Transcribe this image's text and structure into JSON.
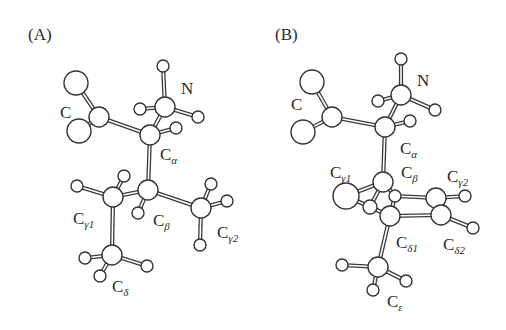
{
  "figure": {
    "type": "ball-and-stick molecular conformation diagram",
    "panels": [
      {
        "id": "A",
        "label": "(A)",
        "label_pos": [
          28,
          40
        ],
        "atoms": [
          {
            "id": "O1",
            "x": 76,
            "y": 83,
            "r": 12
          },
          {
            "id": "O2",
            "x": 79,
            "y": 131,
            "r": 12
          },
          {
            "id": "C",
            "x": 99,
            "y": 117,
            "r": 10
          },
          {
            "id": "Ca",
            "x": 150,
            "y": 135,
            "r": 10
          },
          {
            "id": "N",
            "x": 165,
            "y": 107,
            "r": 10
          },
          {
            "id": "HN1",
            "x": 163,
            "y": 66,
            "r": 6
          },
          {
            "id": "HN2",
            "x": 140,
            "y": 109,
            "r": 6
          },
          {
            "id": "HN3",
            "x": 198,
            "y": 117,
            "r": 6
          },
          {
            "id": "HCa",
            "x": 176,
            "y": 128,
            "r": 6
          },
          {
            "id": "Cb",
            "x": 148,
            "y": 190,
            "r": 10
          },
          {
            "id": "HCb",
            "x": 138,
            "y": 213,
            "r": 6
          },
          {
            "id": "Cg1",
            "x": 113,
            "y": 197,
            "r": 10
          },
          {
            "id": "HCg1a",
            "x": 124,
            "y": 176,
            "r": 6
          },
          {
            "id": "HCg1b",
            "x": 77,
            "y": 186,
            "r": 6
          },
          {
            "id": "Cg2",
            "x": 201,
            "y": 208,
            "r": 10
          },
          {
            "id": "HCg2a",
            "x": 211,
            "y": 184,
            "r": 6
          },
          {
            "id": "HCg2b",
            "x": 227,
            "y": 201,
            "r": 6
          },
          {
            "id": "HCg2c",
            "x": 200,
            "y": 245,
            "r": 6
          },
          {
            "id": "Cd",
            "x": 112,
            "y": 255,
            "r": 10
          },
          {
            "id": "HCda",
            "x": 85,
            "y": 258,
            "r": 6
          },
          {
            "id": "HCdb",
            "x": 100,
            "y": 276,
            "r": 6
          },
          {
            "id": "HCdc",
            "x": 147,
            "y": 266,
            "r": 6
          }
        ],
        "bonds": [
          [
            "O1",
            "C"
          ],
          [
            "O2",
            "C"
          ],
          [
            "C",
            "Ca"
          ],
          [
            "Ca",
            "N"
          ],
          [
            "N",
            "HN1"
          ],
          [
            "N",
            "HN2"
          ],
          [
            "N",
            "HN3"
          ],
          [
            "Ca",
            "HCa"
          ],
          [
            "Ca",
            "Cb"
          ],
          [
            "Cb",
            "HCb"
          ],
          [
            "Cb",
            "Cg1"
          ],
          [
            "Cb",
            "Cg2"
          ],
          [
            "Cg1",
            "HCg1a"
          ],
          [
            "Cg1",
            "HCg1b"
          ],
          [
            "Cg1",
            "Cd"
          ],
          [
            "Cg2",
            "HCg2a"
          ],
          [
            "Cg2",
            "HCg2b"
          ],
          [
            "Cg2",
            "HCg2c"
          ],
          [
            "Cd",
            "HCda"
          ],
          [
            "Cd",
            "HCdb"
          ],
          [
            "Cd",
            "HCdc"
          ]
        ],
        "labels": [
          {
            "name": "carboxyl-c",
            "base": "C",
            "sub": "",
            "x": 60,
            "y": 118
          },
          {
            "name": "n",
            "base": "N",
            "sub": "",
            "x": 181,
            "y": 94
          },
          {
            "name": "c-alpha",
            "base": "C",
            "sub": "α",
            "x": 160,
            "y": 160
          },
          {
            "name": "c-gamma1",
            "base": "C",
            "sub": "γ1",
            "x": 73,
            "y": 224
          },
          {
            "name": "c-beta",
            "base": "C",
            "sub": "β",
            "x": 153,
            "y": 226
          },
          {
            "name": "c-gamma2",
            "base": "C",
            "sub": "γ2",
            "x": 217,
            "y": 238
          },
          {
            "name": "c-delta",
            "base": "C",
            "sub": "δ",
            "x": 112,
            "y": 292
          }
        ]
      },
      {
        "id": "B",
        "label": "(B)",
        "label_pos": [
          275,
          40
        ],
        "atoms": [
          {
            "id": "O1",
            "x": 312,
            "y": 82,
            "r": 12
          },
          {
            "id": "O2",
            "x": 303,
            "y": 132,
            "r": 12
          },
          {
            "id": "C",
            "x": 332,
            "y": 117,
            "r": 10
          },
          {
            "id": "Ca",
            "x": 385,
            "y": 127,
            "r": 10
          },
          {
            "id": "N",
            "x": 401,
            "y": 95,
            "r": 10
          },
          {
            "id": "HN1",
            "x": 401,
            "y": 59,
            "r": 6
          },
          {
            "id": "HN2",
            "x": 378,
            "y": 101,
            "r": 6
          },
          {
            "id": "HN3",
            "x": 435,
            "y": 110,
            "r": 6
          },
          {
            "id": "HCa",
            "x": 410,
            "y": 121,
            "r": 6
          },
          {
            "id": "Cg1",
            "x": 346,
            "y": 196,
            "r": 13
          },
          {
            "id": "Hhid",
            "x": 370,
            "y": 207,
            "r": 7
          },
          {
            "id": "Cb",
            "x": 383,
            "y": 182,
            "r": 10
          },
          {
            "id": "HCb",
            "x": 395,
            "y": 196,
            "r": 6
          },
          {
            "id": "Cd1",
            "x": 390,
            "y": 216,
            "r": 10
          },
          {
            "id": "Cg2",
            "x": 436,
            "y": 198,
            "r": 10
          },
          {
            "id": "HCg2",
            "x": 465,
            "y": 196,
            "r": 6
          },
          {
            "id": "Cd2",
            "x": 441,
            "y": 215,
            "r": 10
          },
          {
            "id": "HCd2",
            "x": 473,
            "y": 228,
            "r": 6
          },
          {
            "id": "Ce",
            "x": 378,
            "y": 267,
            "r": 10
          },
          {
            "id": "HCea",
            "x": 342,
            "y": 265,
            "r": 6
          },
          {
            "id": "HCeb",
            "x": 406,
            "y": 281,
            "r": 6
          },
          {
            "id": "HCec",
            "x": 373,
            "y": 290,
            "r": 6
          }
        ],
        "bonds": [
          [
            "O1",
            "C"
          ],
          [
            "O2",
            "C"
          ],
          [
            "C",
            "Ca"
          ],
          [
            "Ca",
            "N"
          ],
          [
            "N",
            "HN1"
          ],
          [
            "N",
            "HN2"
          ],
          [
            "N",
            "HN3"
          ],
          [
            "Ca",
            "HCa"
          ],
          [
            "Ca",
            "Cb"
          ],
          [
            "Cb",
            "Cg1"
          ],
          [
            "Cg1",
            "Cd1"
          ],
          [
            "Cb",
            "Hhid"
          ],
          [
            "Cb",
            "HCb"
          ],
          [
            "HCb",
            "Cg2"
          ],
          [
            "HCb",
            "Cd1"
          ],
          [
            "Cg2",
            "HCg2"
          ],
          [
            "Cg2",
            "Cd2"
          ],
          [
            "Cd1",
            "Cd2"
          ],
          [
            "Cd2",
            "HCd2"
          ],
          [
            "Cd1",
            "Ce"
          ],
          [
            "Ce",
            "HCea"
          ],
          [
            "Ce",
            "HCeb"
          ],
          [
            "Ce",
            "HCec"
          ]
        ],
        "labels": [
          {
            "name": "carboxyl-c",
            "base": "C",
            "sub": "",
            "x": 291,
            "y": 110
          },
          {
            "name": "n",
            "base": "N",
            "sub": "",
            "x": 417,
            "y": 86
          },
          {
            "name": "c-alpha",
            "base": "C",
            "sub": "α",
            "x": 400,
            "y": 154
          },
          {
            "name": "c-gamma1",
            "base": "C",
            "sub": "γ1",
            "x": 330,
            "y": 178
          },
          {
            "name": "c-beta",
            "base": "C",
            "sub": "β",
            "x": 401,
            "y": 178
          },
          {
            "name": "c-gamma2",
            "base": "C",
            "sub": "γ2",
            "x": 447,
            "y": 182
          },
          {
            "name": "c-delta1",
            "base": "C",
            "sub": "δ1",
            "x": 396,
            "y": 248
          },
          {
            "name": "c-delta2",
            "base": "C",
            "sub": "δ2",
            "x": 443,
            "y": 250
          },
          {
            "name": "c-epsilon",
            "base": "C",
            "sub": "ε",
            "x": 387,
            "y": 307
          }
        ]
      }
    ]
  }
}
